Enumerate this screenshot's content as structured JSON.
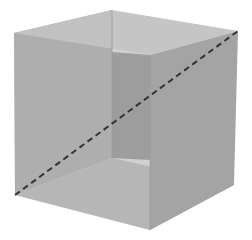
{
  "figure": {
    "type": "cube-diagram",
    "colors": {
      "background": "#ffffff",
      "front_face": "#a9a9a9",
      "top_face": "#c2c2c2",
      "right_face": "#a4a4a4",
      "bottom_face": "#c6c6c6",
      "inner_back_face": "#8f8f8f",
      "left_face": "#b3b3b3",
      "diagonal": "#333333"
    },
    "diagonal": {
      "style": "dashed",
      "from": [
        15,
        195
      ],
      "to": [
        238,
        31
      ]
    }
  }
}
